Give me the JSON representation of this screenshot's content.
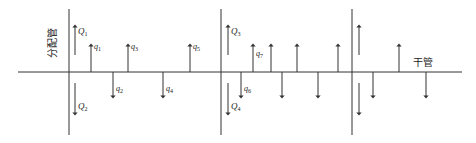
{
  "labels": {
    "distribution_pipe": "分配管",
    "trunk_pipe": "干管"
  },
  "colors": {
    "line": "#333333",
    "text": "#222222",
    "background": "#ffffff"
  },
  "distribution_pipes": [
    {
      "id": "pipe-1",
      "up_flow": {
        "symbol": "Q",
        "sub": "1"
      },
      "down_flow": {
        "symbol": "Q",
        "sub": "2"
      }
    },
    {
      "id": "pipe-2",
      "up_flow": {
        "symbol": "Q",
        "sub": "3"
      },
      "down_flow": {
        "symbol": "Q",
        "sub": "4"
      }
    },
    {
      "id": "pipe-3",
      "up_flow": {
        "symbol": "",
        "sub": ""
      },
      "down_flow": {
        "symbol": "",
        "sub": ""
      }
    }
  ],
  "branch_flows": [
    {
      "direction": "up",
      "symbol": "q",
      "sub": "1"
    },
    {
      "direction": "down",
      "symbol": "q",
      "sub": "2"
    },
    {
      "direction": "up",
      "symbol": "q",
      "sub": "3"
    },
    {
      "direction": "down",
      "symbol": "q",
      "sub": "4"
    },
    {
      "direction": "up",
      "symbol": "q",
      "sub": "5"
    },
    {
      "direction": "down",
      "symbol": "q",
      "sub": "6"
    },
    {
      "direction": "up",
      "symbol": "q",
      "sub": "7"
    },
    {
      "direction": "up",
      "symbol": "",
      "sub": ""
    },
    {
      "direction": "down",
      "symbol": "",
      "sub": ""
    },
    {
      "direction": "up",
      "symbol": "",
      "sub": ""
    },
    {
      "direction": "down",
      "symbol": "",
      "sub": ""
    },
    {
      "direction": "up",
      "symbol": "",
      "sub": ""
    },
    {
      "direction": "down",
      "symbol": "",
      "sub": ""
    },
    {
      "direction": "up",
      "symbol": "",
      "sub": ""
    },
    {
      "direction": "down",
      "symbol": "",
      "sub": ""
    }
  ]
}
